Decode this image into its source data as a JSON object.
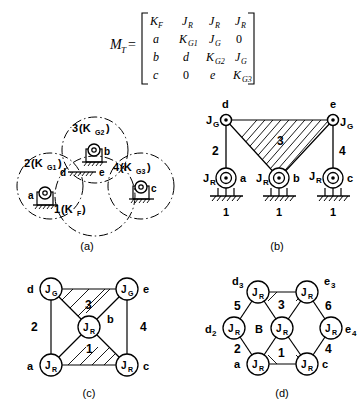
{
  "figure": {
    "matrix": {
      "name": "M",
      "name_sub": "T",
      "equals": "=",
      "rows": [
        [
          "K_F",
          "J_R",
          "J_R",
          "J_R"
        ],
        [
          "a",
          "K_G1",
          "J_G",
          "0"
        ],
        [
          "b",
          "d",
          "K_G2",
          "J_G"
        ],
        [
          "c",
          "0",
          "e",
          "K_G3"
        ]
      ],
      "cells": [
        [
          {
            "base": "K",
            "sub": "F"
          },
          {
            "base": "J",
            "sub": "R"
          },
          {
            "base": "J",
            "sub": "R"
          },
          {
            "base": "J",
            "sub": "R"
          }
        ],
        [
          {
            "base": "a",
            "sub": ""
          },
          {
            "base": "K",
            "sub": "G1"
          },
          {
            "base": "J",
            "sub": "G"
          },
          {
            "base": "0",
            "sub": ""
          }
        ],
        [
          {
            "base": "b",
            "sub": ""
          },
          {
            "base": "d",
            "sub": ""
          },
          {
            "base": "K",
            "sub": "G2"
          },
          {
            "base": "J",
            "sub": "G"
          }
        ],
        [
          {
            "base": "c",
            "sub": ""
          },
          {
            "base": "0",
            "sub": ""
          },
          {
            "base": "e",
            "sub": ""
          },
          {
            "base": "K",
            "sub": "G3"
          }
        ]
      ]
    },
    "captions": {
      "a": "(a)",
      "b": "(b)",
      "c": "(c)",
      "d": "(d)"
    },
    "panel_a": {
      "circles": [
        {
          "id": "link1",
          "label_num": "1",
          "label_paren_open": "(K",
          "label_sub": "F",
          "label_paren_close": ")"
        },
        {
          "id": "link2",
          "label_num": "2",
          "label_paren_open": "(K",
          "label_sub": "G1",
          "label_paren_close": ")"
        },
        {
          "id": "link3",
          "label_num": "3",
          "label_paren_open": "(K",
          "label_sub": "G2",
          "label_paren_close": ")"
        },
        {
          "id": "link4",
          "label_num": "4",
          "label_paren_open": "(K",
          "label_sub": "G3",
          "label_paren_close": ")"
        }
      ],
      "joint_labels": [
        "a",
        "b",
        "c",
        "d",
        "e"
      ]
    },
    "panel_b": {
      "top_node_labels": [
        "d",
        "e"
      ],
      "top_joint_types": [
        "J_G",
        "J_G"
      ],
      "top_joint_parts": [
        {
          "base": "J",
          "sub": "G"
        },
        {
          "base": "J",
          "sub": "G"
        }
      ],
      "bottom_joint_parts": [
        {
          "base": "J",
          "sub": "R"
        },
        {
          "base": "J",
          "sub": "R"
        },
        {
          "base": "J",
          "sub": "R"
        }
      ],
      "bottom_node_labels": [
        "a",
        "b",
        "c"
      ],
      "ground_labels": [
        "1",
        "1",
        "1"
      ],
      "link_labels": {
        "left": "2",
        "middle": "3",
        "right": "4"
      }
    },
    "panel_c": {
      "nodes": [
        {
          "id": "d",
          "outer": "d",
          "base": "J",
          "sub": "G"
        },
        {
          "id": "e",
          "outer": "e",
          "base": "J",
          "sub": "G"
        },
        {
          "id": "center",
          "outer": "b",
          "base": "J",
          "sub": "R"
        },
        {
          "id": "a",
          "outer": "a",
          "base": "J",
          "sub": "R"
        },
        {
          "id": "c",
          "outer": "c",
          "base": "J",
          "sub": "R"
        }
      ],
      "edge_labels": {
        "left": "2",
        "right": "4",
        "upper": "3",
        "lower": "1",
        "center_side": "b"
      }
    },
    "panel_d": {
      "nodes": [
        {
          "id": "d3",
          "outer": "d",
          "outer_sub": "3",
          "base": "J",
          "sub": "R"
        },
        {
          "id": "e3",
          "outer": "e",
          "outer_sub": "3",
          "base": "J",
          "sub": "R"
        },
        {
          "id": "d2",
          "outer": "d",
          "outer_sub": "2",
          "base": "J",
          "sub": "R"
        },
        {
          "id": "B",
          "outer": "B",
          "outer_sub": "",
          "base": "J",
          "sub": "R"
        },
        {
          "id": "e4",
          "outer": "e",
          "outer_sub": "4",
          "base": "J",
          "sub": "R"
        },
        {
          "id": "a",
          "outer": "a",
          "outer_sub": "",
          "base": "J",
          "sub": "R"
        },
        {
          "id": "c",
          "outer": "c",
          "outer_sub": "",
          "base": "J",
          "sub": "R"
        }
      ],
      "edge_labels": {
        "ul": "5",
        "ur": "6",
        "ll": "2",
        "lr": "4",
        "upper": "3",
        "lower": "1"
      }
    }
  },
  "colors": {
    "ink": "#000000",
    "paper": "#ffffff"
  }
}
